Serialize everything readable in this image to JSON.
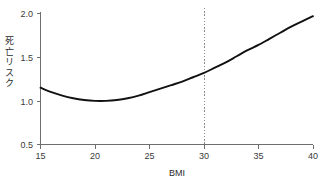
{
  "chart_data": {
    "type": "line",
    "title": "",
    "subtitle": "",
    "xlabel": "BMI",
    "ylabel": "死亡リスク",
    "xlim": [
      15,
      40
    ],
    "ylim": [
      0.5,
      2.0
    ],
    "xticks": [
      15,
      20,
      25,
      30,
      35,
      40
    ],
    "xtick_labels": [
      "15",
      "20",
      "25",
      "30",
      "35",
      "40"
    ],
    "yticks": [
      0.5,
      1.0,
      1.5,
      2.0
    ],
    "ytick_labels": [
      "0.5",
      "1.0",
      "1.5",
      "2.0"
    ],
    "grid": false,
    "legend": null,
    "legend_position": "none",
    "series": [
      {
        "name": "死亡リスク",
        "color": "#111111",
        "x": [
          15,
          16,
          17,
          18,
          19,
          20,
          21,
          22,
          23,
          24,
          25,
          26,
          27,
          28,
          29,
          30,
          31,
          32,
          33,
          34,
          35,
          36,
          37,
          38,
          39,
          40
        ],
        "y": [
          1.15,
          1.1,
          1.06,
          1.03,
          1.01,
          1.0,
          1.0,
          1.01,
          1.03,
          1.06,
          1.1,
          1.14,
          1.18,
          1.22,
          1.27,
          1.32,
          1.38,
          1.44,
          1.51,
          1.58,
          1.64,
          1.71,
          1.78,
          1.85,
          1.91,
          1.97
        ]
      }
    ],
    "annotations": [
      {
        "name": "obesity-threshold",
        "type": "vline",
        "x": 30,
        "label": "",
        "style": "dotted",
        "color": "#8a8a8a"
      }
    ]
  },
  "axes": {
    "x_title": "BMI",
    "y_title_chars": [
      "死",
      "亡",
      "リ",
      "ス",
      "ク"
    ],
    "x_tick_labels": [
      "15",
      "20",
      "25",
      "30",
      "35",
      "40"
    ],
    "y_tick_labels": [
      "2.0",
      "1.5",
      "1.0",
      "0.5"
    ]
  },
  "colors": {
    "background": "#ffffff",
    "curve": "#111111",
    "axis": "#6e6e6e",
    "text": "#2b2b2b",
    "reference_line": "#8a8a8a"
  }
}
